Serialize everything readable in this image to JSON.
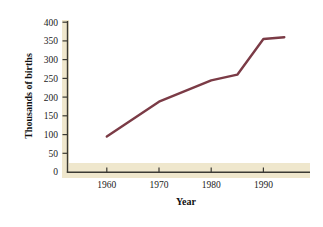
{
  "chart_data": {
    "type": "line",
    "title": "",
    "xlabel": "Year",
    "ylabel": "Thousands of births",
    "xlim": [
      1953,
      1997
    ],
    "ylim": [
      0,
      400
    ],
    "grid": false,
    "legend": "none",
    "line_color": "#7B3B46",
    "x": [
      1960,
      1970,
      1980,
      1985,
      1990,
      1994
    ],
    "values": [
      95,
      188,
      245,
      260,
      355,
      360
    ],
    "xticks": [
      1960,
      1970,
      1980,
      1990
    ],
    "xtick_labels": [
      "1960",
      "1970",
      "1980",
      "1990"
    ],
    "yticks": [
      0,
      50,
      100,
      150,
      200,
      250,
      300,
      350,
      400
    ],
    "ytick_labels": [
      "0",
      "50",
      "100",
      "150",
      "200",
      "250",
      "300",
      "350",
      "400"
    ],
    "series": [
      {
        "name": "Thousands of births",
        "x": [
          1960,
          1970,
          1980,
          1985,
          1990,
          1994
        ],
        "values": [
          95,
          188,
          245,
          260,
          355,
          360
        ]
      }
    ]
  },
  "axes": {
    "y_title": "Thousands of births",
    "x_title": "Year",
    "y_tick_labels": [
      "400",
      "350",
      "300",
      "250",
      "200",
      "150",
      "100",
      "50",
      "0"
    ],
    "x_tick_labels": [
      "1960",
      "1970",
      "1980",
      "1990"
    ]
  },
  "colors": {
    "line": "#7B3B46",
    "axis": "#3b3a34",
    "shadow_band": "#efe7cd",
    "background": "#ffffff"
  }
}
